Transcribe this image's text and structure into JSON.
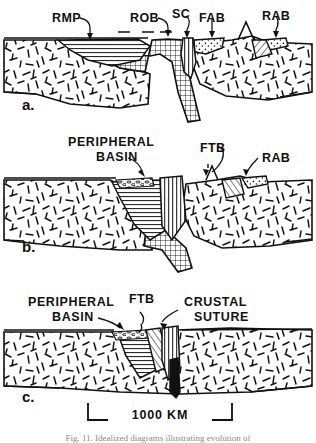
{
  "figure": {
    "title_letters": [
      "a.",
      "b.",
      "c."
    ],
    "scale_bar": {
      "label": "1000 KM",
      "x_start": 88,
      "x_end": 232,
      "y": 414
    },
    "caption": "Fig. 11.  Idealized diagrams illustrating evolution of"
  },
  "panels": [
    {
      "id": "a",
      "letter": "a.",
      "letter_x": 22,
      "letter_y": 110,
      "labels": [
        {
          "text": "RMP",
          "x": 52,
          "y": 22,
          "name": "label-rmp"
        },
        {
          "text": "ROB",
          "x": 130,
          "y": 22,
          "name": "label-rob"
        },
        {
          "text": "SC",
          "x": 176,
          "y": 18,
          "name": "label-sc"
        },
        {
          "text": "FAB",
          "x": 200,
          "y": 22,
          "name": "label-fab"
        },
        {
          "text": "RAB",
          "x": 262,
          "y": 20,
          "name": "label-rab"
        }
      ]
    },
    {
      "id": "b",
      "letter": "b.",
      "letter_x": 22,
      "letter_y": 250,
      "labels": [
        {
          "text": "PERIPHERAL",
          "x": 68,
          "y": 146,
          "name": "label-peripheral"
        },
        {
          "text": "BASIN",
          "x": 92,
          "y": 161,
          "name": "label-basin"
        },
        {
          "text": "FTB",
          "x": 202,
          "y": 152,
          "name": "label-ftb"
        },
        {
          "text": "RAB",
          "x": 262,
          "y": 162,
          "name": "label-rab"
        }
      ]
    },
    {
      "id": "c",
      "letter": "c.",
      "letter_x": 22,
      "letter_y": 400,
      "labels": [
        {
          "text": "PERIPHERAL",
          "x": 30,
          "y": 306,
          "name": "label-peripheral"
        },
        {
          "text": "BASIN",
          "x": 52,
          "y": 321,
          "name": "label-basin"
        },
        {
          "text": "FTB",
          "x": 131,
          "y": 303,
          "name": "label-ftb"
        },
        {
          "text": "CRUSTAL",
          "x": 185,
          "y": 306,
          "name": "label-crustal"
        },
        {
          "text": "SUTURE",
          "x": 194,
          "y": 321,
          "name": "label-suture"
        }
      ]
    }
  ],
  "legend_terms": {
    "RMP": "Rifted Margin Prism",
    "ROB": "Remnant Ocean Basin",
    "SC": "Subduction Complex",
    "FAB": "Fore-Arc Basin",
    "RAB": "Rear-Arc Basin",
    "FTB": "Fold-Thrust Belt"
  },
  "colors": {
    "ink": "#111111",
    "paper": "#ffffff",
    "caption": "#8a8a8a"
  }
}
